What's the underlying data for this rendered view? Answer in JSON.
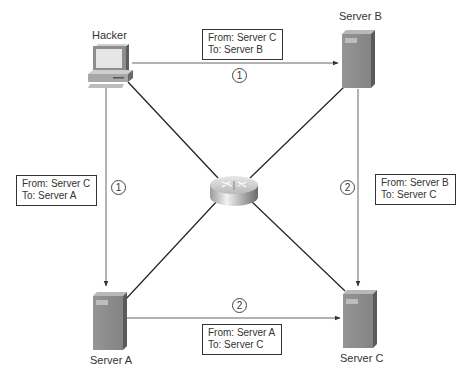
{
  "nodes": {
    "hacker": {
      "label": "Hacker",
      "icon": "workstation-icon"
    },
    "server_a": {
      "label": "Server A",
      "icon": "server-icon"
    },
    "server_b": {
      "label": "Server B",
      "icon": "server-icon"
    },
    "server_c": {
      "label": "Server C",
      "icon": "server-icon"
    },
    "router": {
      "label": "",
      "icon": "router-icon"
    }
  },
  "messages": {
    "hacker_to_b": {
      "from": "From: Server C",
      "to": "To: Server B",
      "step": "1"
    },
    "hacker_to_a": {
      "from": "From: Server C",
      "to": "To: Server A",
      "step": "1"
    },
    "b_to_c": {
      "from": "From: Server B",
      "to": "To: Server C",
      "step": "2"
    },
    "a_to_c": {
      "from": "From: Server A",
      "to": "To: Server C",
      "step": "2"
    }
  },
  "colors": {
    "line": "#555555",
    "diag_line": "#222222",
    "server_body": "#8a8a8a",
    "server_side": "#5a5a5a",
    "server_top": "#b5b5b5"
  }
}
